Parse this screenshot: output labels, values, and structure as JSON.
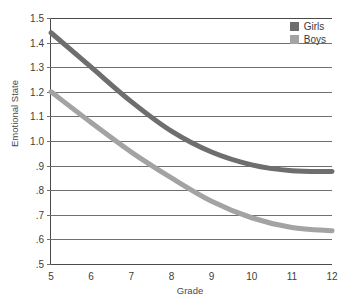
{
  "chart_data": {
    "type": "line",
    "title": "",
    "xlabel": "Grade",
    "ylabel": "Emotional State",
    "xlim": [
      5,
      12
    ],
    "ylim": [
      0.5,
      1.5
    ],
    "grid": "horizontal",
    "legend_position": "top-right",
    "x": [
      5,
      6,
      7,
      8,
      9,
      10,
      11,
      12
    ],
    "xtick_labels": [
      "5",
      "6",
      "7",
      "8",
      "9",
      "10",
      "11",
      "12"
    ],
    "ytick_values": [
      1.5,
      1.4,
      1.3,
      1.2,
      1.1,
      1.0,
      0.9,
      0.8,
      0.7,
      0.6,
      0.5
    ],
    "ytick_labels": [
      "1.5",
      "1.4",
      "1.3",
      "1.2",
      "1.1",
      "1.0",
      ".9",
      ".8",
      ".7",
      ".6",
      ".5"
    ],
    "series": [
      {
        "name": "Girls",
        "color": "#6e6e6e",
        "values": [
          1.44,
          1.3,
          1.16,
          1.04,
          0.955,
          0.903,
          0.879,
          0.876
        ]
      },
      {
        "name": "Boys",
        "color": "#a3a3a3",
        "values": [
          1.2,
          1.075,
          0.955,
          0.85,
          0.755,
          0.688,
          0.648,
          0.635
        ]
      }
    ]
  },
  "legend": {
    "entries": [
      {
        "label": "Girls",
        "color": "#6e6e6e"
      },
      {
        "label": "Boys",
        "color": "#a3a3a3"
      }
    ]
  },
  "axes": {
    "x_title": "Grade",
    "y_title": "Emotional State"
  }
}
